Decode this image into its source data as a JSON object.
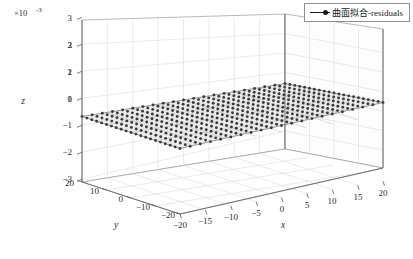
{
  "figure": {
    "exponent_label": "×10",
    "exponent_sup": "-3",
    "legend": {
      "marker_icon": "line-circle-marker-icon",
      "label": "曲面拟合-residuals"
    },
    "colors": {
      "surface_fill": "#e8e8e8",
      "surface_edge": "#6e6e6e",
      "marker": "#3a3a3a",
      "axis": "#707070",
      "grid": "#d9d9d9",
      "text": "#1a1a1a",
      "background": "#ffffff"
    }
  },
  "chart_data": {
    "type": "scatter",
    "title": "",
    "xlabel": "x",
    "ylabel": "y",
    "zlabel": "z",
    "z_exponent": -3,
    "xlim": [
      -20,
      20
    ],
    "ylim": [
      -20,
      20
    ],
    "zlim": [
      -0.003,
      0.003
    ],
    "xticks": [
      -20,
      -15,
      -10,
      -5,
      0,
      5,
      10,
      15,
      20
    ],
    "xticklabels": [
      "−20",
      "−15",
      "−10",
      "−5",
      "0",
      "5",
      "10",
      "15",
      "20"
    ],
    "yticks": [
      20,
      10,
      0,
      -10,
      -20
    ],
    "yticklabels": [
      "20",
      "10",
      "0",
      "−10",
      "−20"
    ],
    "zticks": [
      3,
      2,
      1,
      0,
      -1,
      -2,
      -3
    ],
    "zticklabels": [
      "3",
      "2",
      "1",
      "0",
      "−1",
      "−2",
      "−3"
    ],
    "grid": true,
    "legend_position": "top-right",
    "series": [
      {
        "name": "曲面拟合-residuals",
        "marker": "o",
        "marker_color": "#3a3a3a",
        "surface": "flat-plane-at-zero",
        "grid_nx": 21,
        "grid_ny": 21,
        "z_values_note": "all residuals ≈ 0 (flat plane at z = 0)",
        "z_mean": 0.0
      }
    ]
  }
}
